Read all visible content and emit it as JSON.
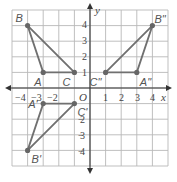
{
  "graph": {
    "x_range": [
      -5,
      5
    ],
    "y_range": [
      -5,
      5
    ],
    "origin_label": "O",
    "x_axis_label": "x",
    "y_axis_label": "y",
    "x_tick_labels": [
      "−4",
      "−3",
      "−2",
      "1",
      "2",
      "3",
      "4"
    ],
    "y_tick_labels": [
      "4",
      "3",
      "2",
      "1",
      "2",
      "3",
      "4"
    ],
    "colors": {
      "triangle_stroke": "#707070",
      "grid": "#b8b8b8",
      "axis": "#333333"
    }
  },
  "triangles": [
    {
      "name": "ABC",
      "points": [
        {
          "label": "A",
          "x": -3,
          "y": 1
        },
        {
          "label": "B",
          "x": -4,
          "y": 4
        },
        {
          "label": "C",
          "x": -1,
          "y": 1
        }
      ]
    },
    {
      "name": "A'B'C'",
      "points": [
        {
          "label": "A'",
          "x": -3,
          "y": -1
        },
        {
          "label": "B'",
          "x": -4,
          "y": -4
        },
        {
          "label": "C'",
          "x": -1,
          "y": -1
        }
      ]
    },
    {
      "name": "A''B''C''",
      "points": [
        {
          "label": "A''",
          "x": 3,
          "y": 1
        },
        {
          "label": "B''",
          "x": 4,
          "y": 4
        },
        {
          "label": "C''",
          "x": 1,
          "y": 1
        }
      ]
    }
  ]
}
